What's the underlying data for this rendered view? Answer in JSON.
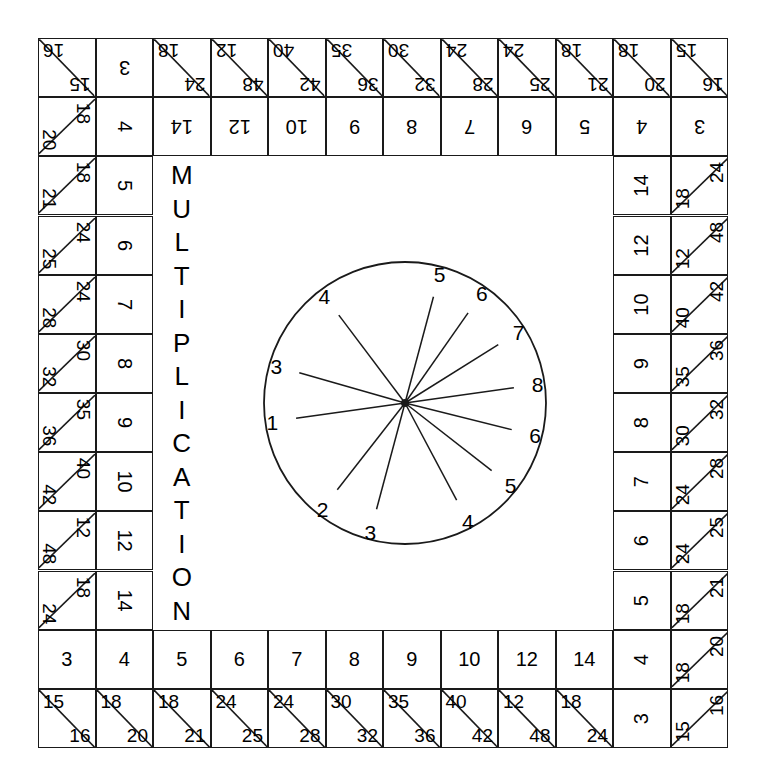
{
  "title": {
    "text": "MULTIPLICATION",
    "letters": [
      "M",
      "U",
      "L",
      "T",
      "I",
      "P",
      "L",
      "I",
      "C",
      "A",
      "T",
      "I",
      "O",
      "N"
    ]
  },
  "board": {
    "grid_cols": 12,
    "grid_rows": 12,
    "line_color": "#1a1a1a",
    "background": "#ffffff"
  },
  "spinner": {
    "type": "wheel",
    "spokes": 12,
    "labels": [
      "5",
      "6",
      "7",
      "8",
      "6",
      "5",
      "4",
      "3",
      "2",
      "1",
      "3",
      "4"
    ],
    "label_angles_deg": [
      -75,
      -55,
      -32,
      -8,
      14,
      38,
      62,
      105,
      128,
      172,
      196,
      233
    ]
  },
  "top_row": {
    "corner_left": {
      "upper": "15",
      "lower": "16"
    },
    "plain": "3",
    "split_cells": [
      {
        "upper": "24",
        "lower": "18"
      },
      {
        "upper": "48",
        "lower": "12"
      },
      {
        "upper": "42",
        "lower": "40"
      },
      {
        "upper": "36",
        "lower": "35"
      },
      {
        "upper": "32",
        "lower": "30"
      },
      {
        "upper": "28",
        "lower": "24"
      },
      {
        "upper": "25",
        "lower": "24"
      },
      {
        "upper": "21",
        "lower": "18"
      },
      {
        "upper": "20",
        "lower": "18"
      },
      {
        "upper": "16",
        "lower": "15"
      }
    ]
  },
  "top_inner_row": {
    "values": [
      "4",
      "14",
      "12",
      "10",
      "9",
      "8",
      "7",
      "6",
      "5",
      "4",
      "3"
    ]
  },
  "bottom_inner_row": {
    "values": [
      "3",
      "4",
      "5",
      "6",
      "7",
      "8",
      "9",
      "10",
      "12",
      "14",
      "4"
    ]
  },
  "bottom_row": {
    "split_cells": [
      {
        "upper": "15",
        "lower": "16"
      },
      {
        "upper": "18",
        "lower": "20"
      },
      {
        "upper": "18",
        "lower": "21"
      },
      {
        "upper": "24",
        "lower": "25"
      },
      {
        "upper": "24",
        "lower": "28"
      },
      {
        "upper": "30",
        "lower": "32"
      },
      {
        "upper": "35",
        "lower": "36"
      },
      {
        "upper": "40",
        "lower": "42"
      },
      {
        "upper": "12",
        "lower": "48"
      },
      {
        "upper": "18",
        "lower": "24"
      }
    ],
    "plain": "3",
    "corner_right": {
      "upper": "15",
      "lower": "16"
    }
  },
  "left_column": {
    "split_cells": [
      {
        "upper": "18",
        "lower": "20"
      },
      {
        "upper": "18",
        "lower": "21"
      },
      {
        "upper": "24",
        "lower": "25"
      },
      {
        "upper": "24",
        "lower": "28"
      },
      {
        "upper": "30",
        "lower": "32"
      },
      {
        "upper": "35",
        "lower": "36"
      },
      {
        "upper": "40",
        "lower": "42"
      },
      {
        "upper": "12",
        "lower": "48"
      },
      {
        "upper": "18",
        "lower": "24"
      }
    ],
    "inner_values": [
      "4",
      "5",
      "6",
      "7",
      "8",
      "9",
      "10",
      "12",
      "14"
    ]
  },
  "right_column": {
    "split_cells": [
      {
        "upper": "18",
        "lower": "24"
      },
      {
        "upper": "12",
        "lower": "48"
      },
      {
        "upper": "40",
        "lower": "42"
      },
      {
        "upper": "35",
        "lower": "36"
      },
      {
        "upper": "30",
        "lower": "32"
      },
      {
        "upper": "24",
        "lower": "28"
      },
      {
        "upper": "24",
        "lower": "25"
      },
      {
        "upper": "18",
        "lower": "21"
      },
      {
        "upper": "18",
        "lower": "20"
      }
    ],
    "inner_values": [
      "14",
      "12",
      "10",
      "9",
      "8",
      "7",
      "6",
      "5",
      "4"
    ]
  }
}
